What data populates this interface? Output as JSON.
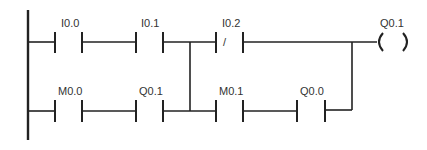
{
  "diagram": {
    "type": "ladder-logic",
    "rung1": {
      "contacts": [
        {
          "label": "I0.0",
          "kind": "normally-open"
        },
        {
          "label": "I0.1",
          "kind": "normally-open"
        },
        {
          "label": "I0.2",
          "kind": "normally-closed",
          "symbol": "/"
        }
      ],
      "coil": {
        "label": "Q0.1",
        "symbol_left": "(",
        "symbol_right": ")"
      }
    },
    "rung2": {
      "contacts": [
        {
          "label": "M0.0",
          "kind": "normally-open"
        },
        {
          "label": "Q0.1",
          "kind": "normally-open"
        },
        {
          "label": "M0.1",
          "kind": "normally-open"
        },
        {
          "label": "Q0.0",
          "kind": "normally-open"
        }
      ]
    },
    "colors": {
      "line": "#222222",
      "background": "#ffffff",
      "text": "#333333"
    }
  }
}
